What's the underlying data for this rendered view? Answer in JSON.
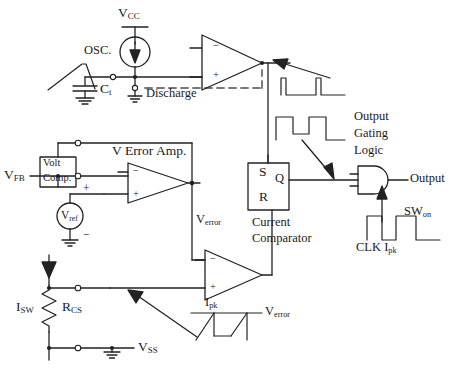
{
  "diagram": {
    "stroke_color": "#222222",
    "background": "#ffffff"
  },
  "labels": {
    "vcc": "V",
    "vcc_sub": "CC",
    "osc": "OSC.",
    "ct": "C",
    "ct_sub": "t",
    "discharge": "Discharge",
    "volt_comp_line1": "Volt",
    "volt_comp_line2": "Comp.",
    "vfb": "V",
    "vfb_sub": "FB",
    "verror_amp": "V Error Amp.",
    "vref": "V",
    "vref_sub": "ref",
    "vref_plus": "+",
    "vref_minus": "−",
    "verror": "V",
    "verror_sub": "error",
    "verror_ramp": "V",
    "verror_ramp_sub": "error",
    "latch_s": "S",
    "latch_q": "Q",
    "latch_r": "R",
    "current_comparator_line1": "Current",
    "current_comparator_line2": "Comparator",
    "output_gating_line1": "Output",
    "output_gating_line2": "Gating",
    "output_gating_line3": "Logic",
    "output": "Output",
    "sw_on": "SW",
    "sw_on_sub": "on",
    "clk_ipk": "CLK I",
    "clk_ipk_sub": "pk",
    "ipk_ramp": "I",
    "ipk_ramp_sub": "pk",
    "isw": "I",
    "isw_sub": "SW",
    "rcs": "R",
    "rcs_sub": "CS",
    "vss": "V",
    "vss_sub": "SS",
    "opamp_minus": "−",
    "opamp_plus": "+"
  }
}
